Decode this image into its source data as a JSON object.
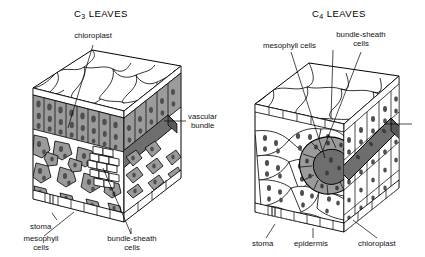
{
  "figure": {
    "kind": "biology-diagram",
    "background_color": "#ffffff",
    "ink_color": "#000000",
    "cell_fill_color": "#9b9b9b",
    "chloroplast_color": "#4f4f4f",
    "vascular_bundle_color": "#6e6e6e",
    "epidermis_fill_color": "#ffffff"
  },
  "panels": [
    {
      "id": "c3",
      "title_prefix": "C",
      "title_sub": "3",
      "title_suffix": " LEAVES",
      "title_plain": "C3 LEAVES",
      "labels": [
        {
          "id": "chloroplast",
          "text": "chloroplast",
          "lines": [
            "chloroplast"
          ]
        },
        {
          "id": "vascular-bundle",
          "text": "vascular bundle",
          "lines": [
            "vascular",
            "bundle"
          ]
        },
        {
          "id": "stoma",
          "text": "stoma",
          "lines": [
            "stoma"
          ]
        },
        {
          "id": "mesophyll-cells",
          "text": "mesophyll cells",
          "lines": [
            "mesophyll",
            "cells"
          ]
        },
        {
          "id": "bundle-sheath-cells",
          "text": "bundle-sheath cells",
          "lines": [
            "bundle-sheath",
            "cells"
          ]
        }
      ]
    },
    {
      "id": "c4",
      "title_prefix": "C",
      "title_sub": "4",
      "title_suffix": " LEAVES",
      "title_plain": "C4 LEAVES",
      "labels": [
        {
          "id": "mesophyll-cells",
          "text": "mesophyll cells",
          "lines": [
            "mesophyll cells"
          ]
        },
        {
          "id": "bundle-sheath-cells",
          "text": "bundle-sheath cells",
          "lines": [
            "bundle-sheath",
            "cells"
          ]
        },
        {
          "id": "stoma",
          "text": "stoma",
          "lines": [
            "stoma"
          ]
        },
        {
          "id": "epidermis",
          "text": "epidermis",
          "lines": [
            "epidermis"
          ]
        },
        {
          "id": "chloroplast",
          "text": "chloroplast",
          "lines": [
            "chloroplast"
          ]
        }
      ]
    }
  ],
  "c3": {
    "title_prefix": "C",
    "title_sub": "3",
    "title_suffix": " LEAVES",
    "label_chloroplast": "chloroplast",
    "label_vascular_1": "vascular",
    "label_vascular_2": "bundle",
    "label_stoma": "stoma",
    "label_mesophyll_1": "mesophyll",
    "label_mesophyll_2": "cells",
    "label_bundlesheath_1": "bundle-sheath",
    "label_bundlesheath_2": "cells"
  },
  "c4": {
    "title_prefix": "C",
    "title_sub": "4",
    "title_suffix": " LEAVES",
    "label_mesophyll": "mesophyll cells",
    "label_bundlesheath_1": "bundle-sheath",
    "label_bundlesheath_2": "cells",
    "label_stoma": "stoma",
    "label_epidermis": "epidermis",
    "label_chloroplast": "chloroplast"
  }
}
